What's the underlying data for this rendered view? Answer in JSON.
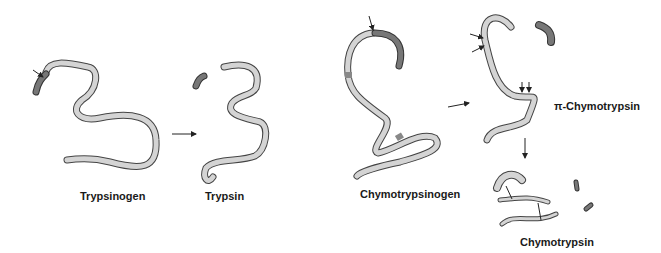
{
  "labels": {
    "trypsinogen": "Trypsinogen",
    "trypsin": "Trypsin",
    "chymotrypsinogen": "Chymotrypsinogen",
    "pi_chymotrypsin": "π-Chymotrypsin",
    "chymotrypsin": "Chymotrypsin"
  },
  "colors": {
    "chain_fill": "#d4d4d4",
    "cleaved_fill": "#777777",
    "outline": "#444444"
  }
}
